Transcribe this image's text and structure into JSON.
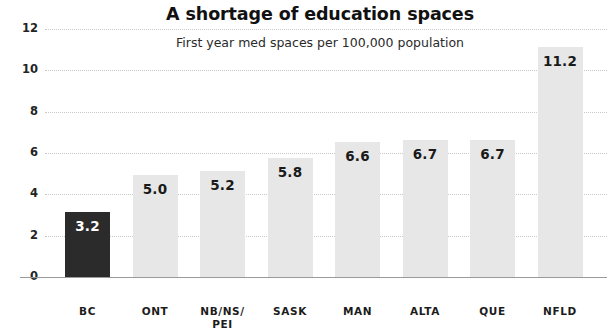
{
  "chart_data": {
    "type": "bar",
    "title": "A shortage of education spaces",
    "subtitle": "First year med spaces per 100,000 population",
    "xlabel": "",
    "ylabel": "",
    "categories": [
      "BC",
      "ONT",
      "NB/NS/ PEI",
      "SASK",
      "MAN",
      "ALTA",
      "QUE",
      "NFLD"
    ],
    "category_lines": [
      [
        "BC"
      ],
      [
        "ONT"
      ],
      [
        "NB/NS/",
        "PEI"
      ],
      [
        "SASK"
      ],
      [
        "MAN"
      ],
      [
        "ALTA"
      ],
      [
        "QUE"
      ],
      [
        "NFLD"
      ]
    ],
    "values": [
      3.2,
      5.0,
      5.2,
      5.8,
      6.6,
      6.7,
      6.7,
      11.2
    ],
    "value_labels": [
      "3.2",
      "5.0",
      "5.2",
      "5.8",
      "6.6",
      "6.7",
      "6.7",
      "11.2"
    ],
    "highlight_index": 0,
    "ylim": [
      0,
      12
    ],
    "yticks": [
      0,
      2,
      4,
      6,
      8,
      10,
      12
    ],
    "ytick_labels": [
      "0",
      "2",
      "4",
      "6",
      "8",
      "10",
      "12"
    ],
    "grid": true,
    "grid_style": "dotted",
    "legend": null,
    "colors": {
      "bar": "#e7e7e7",
      "bar_highlight": "#2b2b2b",
      "value_text": "#1a1a1a",
      "value_text_on_highlight": "#ffffff",
      "grid": "#c9c9c9",
      "axis": "#9a9a9a",
      "title": "#111111",
      "background": "#ffffff"
    }
  }
}
